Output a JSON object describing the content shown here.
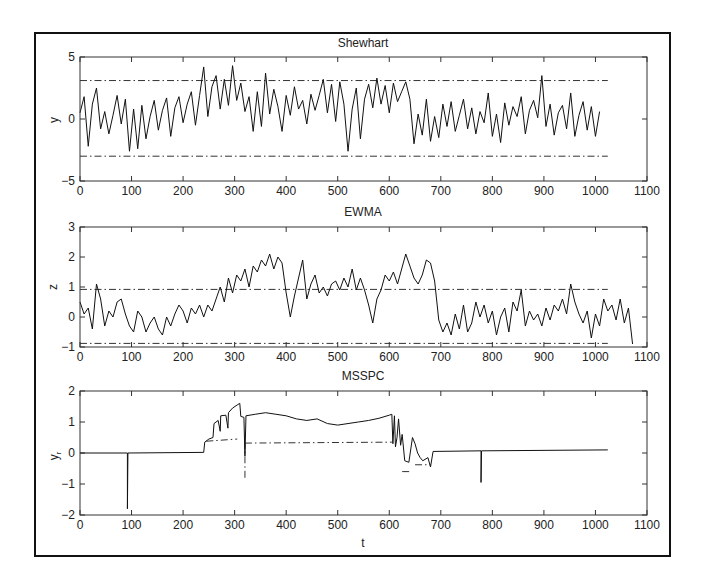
{
  "figure": {
    "frame_color": "#111111"
  },
  "chart_data": [
    {
      "type": "line",
      "title": "Shewhart",
      "xlabel": "",
      "ylabel": "y",
      "xlim": [
        0,
        1100
      ],
      "ylim": [
        -5,
        5
      ],
      "xticks": [
        0,
        100,
        200,
        300,
        400,
        500,
        600,
        700,
        800,
        900,
        1000,
        1100
      ],
      "yticks": [
        -5,
        0,
        5
      ],
      "grid": false,
      "limits": [
        {
          "name": "UCL",
          "value": 3.1,
          "x": [
            0,
            1024
          ]
        },
        {
          "name": "LCL",
          "value": -3.0,
          "x": [
            0,
            1024
          ]
        }
      ],
      "series": [
        {
          "name": "y",
          "x_step": 8,
          "values": [
            0.5,
            1.8,
            -2.2,
            1.2,
            2.5,
            -0.8,
            0.6,
            -1.2,
            0.3,
            1.9,
            -0.4,
            1.6,
            -2.6,
            0.8,
            -2.4,
            1.1,
            -1.6,
            0.2,
            1.5,
            -0.9,
            0.7,
            1.7,
            -1.4,
            0.9,
            1.8,
            -0.3,
            1.2,
            2.2,
            -0.5,
            1.9,
            4.2,
            0.2,
            2.6,
            3.5,
            0.8,
            3.2,
            1.1,
            4.3,
            1.5,
            2.9,
            0.6,
            1.8,
            -1.0,
            2.2,
            -0.6,
            3.7,
            0.4,
            2.4,
            1.0,
            -1.0,
            1.9,
            0.3,
            2.6,
            0.8,
            1.5,
            -0.4,
            2.0,
            0.7,
            1.9,
            3.2,
            0.5,
            2.8,
            -0.2,
            3.0,
            1.2,
            -2.6,
            0.8,
            2.5,
            -1.6,
            1.6,
            2.8,
            0.9,
            3.3,
            1.2,
            2.7,
            0.5,
            2.9,
            1.4,
            2.2,
            3.0,
            1.6,
            -2.0,
            0.4,
            -1.3,
            1.6,
            -1.8,
            0.2,
            -1.5,
            1.2,
            -0.6,
            1.4,
            -1.0,
            0.3,
            1.6,
            -0.8,
            0.9,
            -1.2,
            0.6,
            -0.3,
            2.1,
            -1.4,
            0.4,
            -1.9,
            1.3,
            -0.5,
            1.0,
            0.2,
            1.8,
            -1.2,
            0.7,
            1.5,
            0.1,
            3.5,
            -0.6,
            1.2,
            -1.3,
            0.5,
            1.1,
            -0.8,
            2.1,
            -1.4,
            0.3,
            1.4,
            -0.9,
            1.0,
            -1.4,
            0.6
          ]
        }
      ]
    },
    {
      "type": "line",
      "title": "EWMA",
      "xlabel": "",
      "ylabel": "z",
      "xlim": [
        0,
        1100
      ],
      "ylim": [
        -1,
        3
      ],
      "xticks": [
        0,
        100,
        200,
        300,
        400,
        500,
        600,
        700,
        800,
        900,
        1000,
        1100
      ],
      "yticks": [
        -1,
        0,
        1,
        2,
        3
      ],
      "grid": false,
      "limits": [
        {
          "name": "UCL",
          "value": 0.92,
          "x": [
            0,
            1024
          ]
        },
        {
          "name": "LCL",
          "value": -0.88,
          "x": [
            0,
            1024
          ]
        }
      ],
      "series": [
        {
          "name": "z",
          "x_step": 8,
          "values": [
            0.5,
            0.1,
            0.3,
            -0.4,
            1.1,
            0.6,
            -0.3,
            0.2,
            0.0,
            0.5,
            0.6,
            0.1,
            -0.3,
            -0.5,
            0.2,
            0.0,
            -0.5,
            -0.2,
            0.0,
            -0.4,
            -0.6,
            0.0,
            -0.3,
            0.1,
            0.4,
            0.2,
            -0.2,
            0.3,
            0.1,
            0.4,
            0.0,
            0.4,
            0.2,
            0.6,
            1.0,
            0.5,
            1.3,
            0.8,
            1.4,
            1.2,
            1.6,
            1.0,
            1.7,
            1.5,
            1.9,
            1.7,
            2.1,
            1.6,
            2.0,
            1.8,
            0.8,
            0.0,
            0.7,
            1.3,
            1.9,
            0.6,
            1.1,
            1.4,
            0.8,
            1.0,
            0.7,
            1.1,
            1.2,
            0.9,
            1.3,
            1.0,
            1.6,
            0.9,
            1.3,
            0.9,
            0.4,
            -0.2,
            0.6,
            0.9,
            1.4,
            1.2,
            1.5,
            1.1,
            1.6,
            2.1,
            1.7,
            1.3,
            1.1,
            1.4,
            1.9,
            1.8,
            1.2,
            -0.1,
            -0.5,
            -0.2,
            -0.6,
            0.1,
            -0.4,
            0.4,
            -0.5,
            -0.2,
            0.5,
            0.0,
            0.4,
            -0.2,
            0.2,
            -0.6,
            0.0,
            0.3,
            -0.5,
            0.5,
            0.2,
            0.9,
            -0.3,
            0.2,
            -0.1,
            0.1,
            -0.3,
            0.3,
            -0.1,
            0.4,
            0.2,
            0.6,
            0.1,
            1.1,
            0.5,
            0.1,
            -0.2,
            0.2,
            -0.7,
            0.1,
            -0.3,
            0.6,
            0.2,
            0.4,
            -0.1,
            0.6,
            -0.2,
            0.3,
            -0.9
          ]
        }
      ]
    },
    {
      "type": "line",
      "title": "MSSPC",
      "xlabel": "t",
      "ylabel": "y_r",
      "xlim": [
        0,
        1100
      ],
      "ylim": [
        -2,
        2
      ],
      "xticks": [
        0,
        100,
        200,
        300,
        400,
        500,
        600,
        700,
        800,
        900,
        1000,
        1100
      ],
      "yticks": [
        -2,
        -1,
        0,
        1,
        2
      ],
      "grid": false,
      "limits": [
        {
          "name": "limit-1",
          "points": [
            [
              245,
              0.38
            ],
            [
              305,
              0.45
            ]
          ]
        },
        {
          "name": "limit-2",
          "points": [
            [
              320,
              0.32
            ],
            [
              605,
              0.35
            ]
          ]
        },
        {
          "name": "limit-3",
          "points": [
            [
              625,
              -0.6
            ],
            [
              640,
              -0.6
            ]
          ]
        },
        {
          "name": "limit-4",
          "points": [
            [
              650,
              -0.38
            ],
            [
              680,
              -0.38
            ]
          ]
        },
        {
          "name": "limit-5",
          "points": [
            [
              320,
              -0.8
            ],
            [
              320,
              0.3
            ]
          ]
        }
      ],
      "series": [
        {
          "name": "y_r",
          "points": [
            [
              0,
              0
            ],
            [
              92,
              0
            ],
            [
              92,
              -1.8
            ],
            [
              93,
              0
            ],
            [
              240,
              0.02
            ],
            [
              242,
              0.35
            ],
            [
              250,
              0.45
            ],
            [
              258,
              0.5
            ],
            [
              260,
              0.95
            ],
            [
              268,
              1.05
            ],
            [
              272,
              0.7
            ],
            [
              273,
              1.2
            ],
            [
              283,
              1.22
            ],
            [
              287,
              0.8
            ],
            [
              288,
              1.3
            ],
            [
              296,
              1.45
            ],
            [
              305,
              1.55
            ],
            [
              310,
              1.6
            ],
            [
              312,
              1.18
            ],
            [
              318,
              1.15
            ],
            [
              320,
              -0.1
            ],
            [
              322,
              1.2
            ],
            [
              340,
              1.25
            ],
            [
              360,
              1.3
            ],
            [
              380,
              1.25
            ],
            [
              400,
              1.2
            ],
            [
              420,
              1.1
            ],
            [
              440,
              1.05
            ],
            [
              460,
              1.1
            ],
            [
              480,
              0.95
            ],
            [
              500,
              0.9
            ],
            [
              520,
              0.95
            ],
            [
              540,
              1.0
            ],
            [
              560,
              1.05
            ],
            [
              580,
              1.12
            ],
            [
              600,
              1.22
            ],
            [
              605,
              1.25
            ],
            [
              607,
              0.3
            ],
            [
              610,
              1.2
            ],
            [
              612,
              0.2
            ],
            [
              615,
              0.5
            ],
            [
              618,
              1.1
            ],
            [
              622,
              0.25
            ],
            [
              625,
              0.6
            ],
            [
              630,
              -0.25
            ],
            [
              638,
              -0.3
            ],
            [
              645,
              0.5
            ],
            [
              650,
              0.3
            ],
            [
              655,
              0.0
            ],
            [
              660,
              -0.15
            ],
            [
              665,
              -0.25
            ],
            [
              675,
              -0.15
            ],
            [
              680,
              -0.45
            ],
            [
              685,
              0.05
            ],
            [
              778,
              0.07
            ],
            [
              778,
              -0.95
            ],
            [
              779,
              0.07
            ],
            [
              1024,
              0.1
            ]
          ]
        }
      ]
    }
  ]
}
